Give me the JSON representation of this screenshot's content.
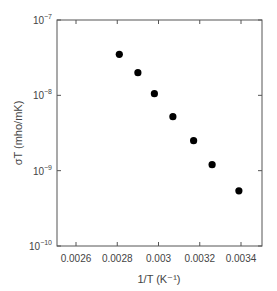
{
  "chart_data": {
    "type": "scatter",
    "title": "",
    "xlabel": "1/T (K⁻¹)",
    "ylabel": "σT (mho/mK)",
    "xscale": "linear",
    "yscale": "log",
    "xlim": [
      0.0025,
      0.00355
    ],
    "ylim": [
      1e-10,
      1e-07
    ],
    "x_ticks": [
      0.0026,
      0.0028,
      0.003,
      0.0032,
      0.0034
    ],
    "x_tick_labels": [
      "0.0026",
      "0.0028",
      "0.003",
      "0.0032",
      "0.0034"
    ],
    "y_ticks": [
      1e-07,
      1e-08,
      1e-09,
      1e-10
    ],
    "y_tick_labels": [
      {
        "base": "10",
        "exp": "-7"
      },
      {
        "base": "10",
        "exp": "-8"
      },
      {
        "base": "10",
        "exp": "-9"
      },
      {
        "base": "10",
        "exp": "-10"
      }
    ],
    "grid": false,
    "legend": null,
    "series": [
      {
        "name": "data",
        "marker": "filled-circle",
        "color": "#000000",
        "x": [
          0.00281,
          0.0029,
          0.00298,
          0.00307,
          0.00317,
          0.00326,
          0.00339
        ],
        "y": [
          3.5e-08,
          2e-08,
          1.05e-08,
          5.2e-09,
          2.5e-09,
          1.2e-09,
          5.4e-10
        ]
      }
    ]
  }
}
